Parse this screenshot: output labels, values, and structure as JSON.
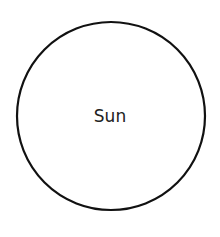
{
  "diagram": {
    "nodes": [
      {
        "label": "Sun",
        "shape": "circle",
        "stroke": "#111111",
        "fill": "#ffffff"
      }
    ]
  }
}
